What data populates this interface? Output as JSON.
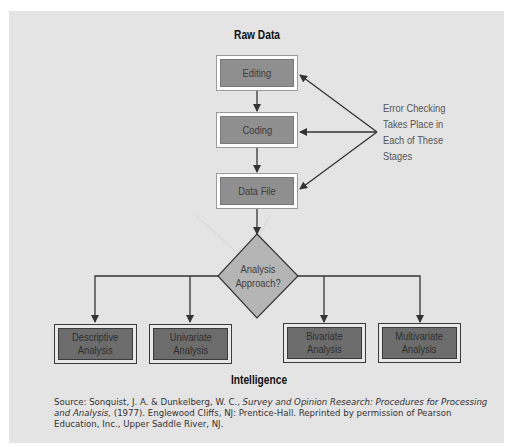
{
  "diagram": {
    "top_label": "Raw Data",
    "bottom_label": "Intelligence",
    "stages": [
      {
        "label": "Editing"
      },
      {
        "label": "Coding"
      },
      {
        "label": "Data File"
      }
    ],
    "decision": {
      "label_line1": "Analysis",
      "label_line2": "Approach?"
    },
    "outcomes": [
      {
        "line1": "Descriptive",
        "line2": "Analysis"
      },
      {
        "line1": "Univariate",
        "line2": "Analysis"
      },
      {
        "line1": "Bivariate",
        "line2": "Analysis"
      },
      {
        "line1": "Multivariate",
        "line2": "Analysis"
      }
    ],
    "note_lines": [
      "Error Checking",
      "Takes Place in",
      "Each of These",
      "Stages"
    ],
    "colors": {
      "panel": "#e4e4e4",
      "stage_fill": "#8f8f8f",
      "decision_fill": "#b5b5b5",
      "outcome_fill": "#6c6c6c",
      "line": "#333333"
    }
  },
  "source": {
    "prefix": "Source: Sonquist, J. A. & Dunkelberg, W. C., ",
    "title": "Survey and Opinion Research: Procedures for Processing and Analysis,",
    "suffix": " (1977). Englewood Cliffs, NJ: Prentice-Hall. Reprinted by permission of Pearson Education, Inc., Upper Saddle River, NJ."
  }
}
